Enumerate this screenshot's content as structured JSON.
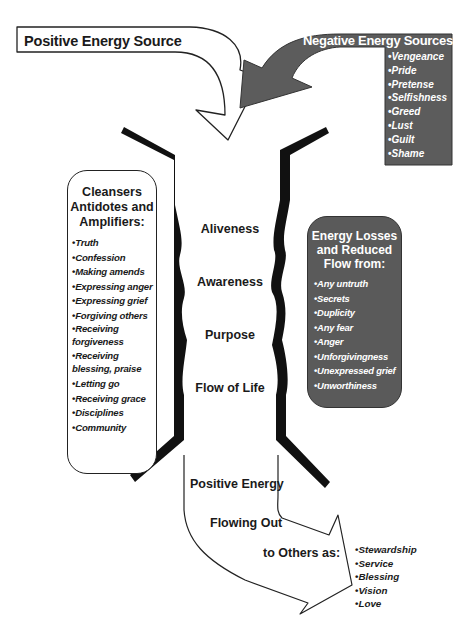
{
  "diagram": {
    "positive_source": {
      "label": "Positive Energy Source",
      "icon": "curved-arrow-white"
    },
    "negative_sources": {
      "title": "Negative Energy Sources:",
      "icon": "curved-arrow-gray",
      "color": "#5a5a5a",
      "items": [
        "Vengeance",
        "Pride",
        "Pretense",
        "Selfishness",
        "Greed",
        "Lust",
        "Guilt",
        "Shame"
      ]
    },
    "cleansers": {
      "title_line1": "Cleansers",
      "title_line2": "Antidotes and",
      "title_line3": "Amplifiers:",
      "items": [
        "Truth",
        "Confession",
        "Making amends",
        "Expressing anger",
        "Expressing grief",
        "Forgiving others",
        "Receiving forgiveness",
        "Receiving blessing, praise",
        "Letting go",
        "Receiving grace",
        "Disciplines",
        "Community"
      ]
    },
    "channel": {
      "labels": [
        "Aliveness",
        "Awareness",
        "Purpose",
        "Flow of Life"
      ],
      "wall_color": "#111111"
    },
    "losses": {
      "title_line1": "Energy Losses",
      "title_line2": "and Reduced",
      "title_line3": "Flow from:",
      "color": "#5a5a5a",
      "items": [
        "Any untruth",
        "Secrets",
        "Duplicity",
        "Any fear",
        "Anger",
        "Unforgivingness",
        "Unexpressed grief",
        "Unworthiness"
      ]
    },
    "outflow": {
      "line1": "Positive Energy",
      "line2": "Flowing Out",
      "line3": "to Others as:",
      "icon": "curved-arrow-outflow",
      "items": [
        "Stewardship",
        "Service",
        "Blessing",
        "Vision",
        "Love"
      ]
    }
  }
}
